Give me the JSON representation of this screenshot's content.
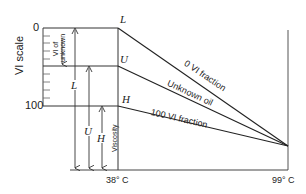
{
  "diagram": {
    "y_axis_title": "VI scale",
    "y_ticks": {
      "top": "0",
      "bottom": "100"
    },
    "x_labels": {
      "left": "38° C",
      "right": "99° C"
    },
    "points": {
      "L": "L",
      "U": "U",
      "H": "H"
    },
    "lines": {
      "zero_vi": "0 VI fraction",
      "unknown": "Unknown oil",
      "hundred_vi": "100 VI fraction"
    },
    "dimensions": {
      "vi_of_unknown": "VI of unknown",
      "L": "L",
      "U": "U",
      "H": "H",
      "viscosity": "Viscosity"
    }
  }
}
